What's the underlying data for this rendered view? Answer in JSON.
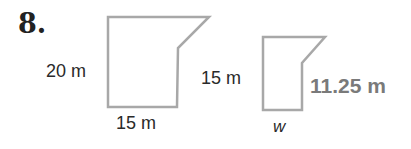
{
  "problem": {
    "number": "8.",
    "large_figure": {
      "height_label": "20 m",
      "base_label": "15 m"
    },
    "small_figure": {
      "height_label": "15 m",
      "right_side_label": "11.25 m",
      "base_label": "w"
    },
    "colors": {
      "outline": "#a8a8a8",
      "answer_text": "#7a7a7a"
    }
  }
}
